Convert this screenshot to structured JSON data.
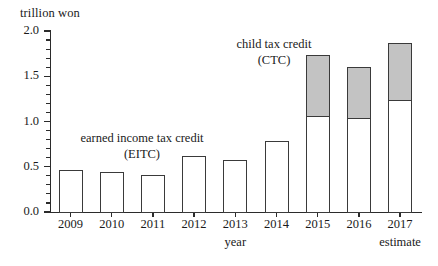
{
  "chart_data": {
    "type": "bar",
    "subtype": "stacked",
    "title": "",
    "xlabel": "year",
    "ylabel": "trillion won",
    "ylim": [
      0.0,
      2.0
    ],
    "ytick_labels": [
      "0.0",
      "0.5",
      "1.0",
      "1.5",
      "2.0"
    ],
    "ytick_values": [
      0.0,
      0.5,
      1.0,
      1.5,
      2.0
    ],
    "minor_tick_step": 0.1,
    "grid": false,
    "legend_position": "in-plot annotations",
    "categories": [
      "2009",
      "2010",
      "2011",
      "2012",
      "2013",
      "2014",
      "2015",
      "2016",
      "2017"
    ],
    "x_sublabels": [
      "",
      "",
      "",
      "",
      "",
      "",
      "",
      "",
      "estimate"
    ],
    "series": [
      {
        "name": "earned income tax credit (EITC)",
        "color": "#ffffff",
        "values": [
          0.46,
          0.44,
          0.41,
          0.62,
          0.57,
          0.78,
          1.06,
          1.04,
          1.24
        ]
      },
      {
        "name": "child tax credit (CTC)",
        "color": "#c3c3c3",
        "values": [
          0.0,
          0.0,
          0.0,
          0.0,
          0.0,
          0.0,
          0.68,
          0.56,
          0.63
        ]
      }
    ],
    "totals": [
      0.46,
      0.44,
      0.41,
      0.62,
      0.57,
      0.78,
      1.74,
      1.6,
      1.87
    ],
    "annotations": [
      {
        "name": "eitc",
        "text": "earned income tax credit\n(EITC)"
      },
      {
        "name": "ctc",
        "text": "child tax credit\n(CTC)"
      }
    ]
  }
}
